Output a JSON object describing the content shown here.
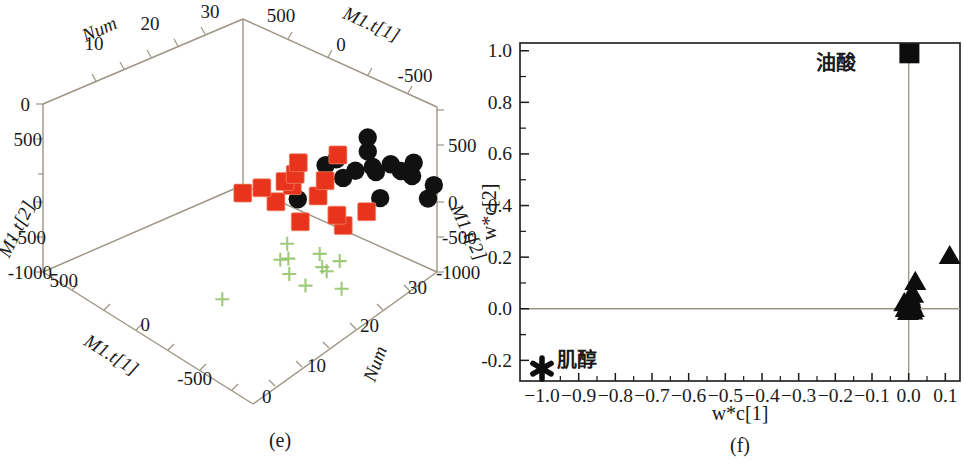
{
  "figure": {
    "panels": [
      {
        "id": "e",
        "caption": "(e)"
      },
      {
        "id": "f",
        "caption": "(f)"
      }
    ]
  },
  "panel_e": {
    "caption": "(e)",
    "axis_titles": {
      "top_left": "Num",
      "top_right": "M1.t[1]",
      "left": "M1.t[2]",
      "right": "M1.t[2]",
      "bottom_left": "M1.t[1]",
      "bottom_right": "Num"
    },
    "ticks": {
      "num_top": [
        "10",
        "20",
        "30"
      ],
      "t1_top": [
        "500",
        "0",
        "-500"
      ],
      "t2_left": [
        "0",
        "500",
        "0",
        "-500",
        "-1000"
      ],
      "t2_right": [
        "500",
        "0",
        "-500",
        "-1000"
      ],
      "t1_bottom": [
        "500",
        "0",
        "-500"
      ],
      "num_bottom": [
        "0",
        "10",
        "20",
        "30"
      ]
    },
    "legend_groups": [
      {
        "name": "black-circles",
        "color": "#111111",
        "marker": "circle"
      },
      {
        "name": "red-squares",
        "color": "#e8341c",
        "marker": "square"
      },
      {
        "name": "green-crosses",
        "color": "#8fbf62",
        "marker": "cross"
      }
    ]
  },
  "panel_f": {
    "caption": "(f)",
    "xlabel": "w*c[1]",
    "ylabel": "w*c[2]",
    "annotations": [
      {
        "text": "油酸",
        "marker": "square",
        "x": 0.0,
        "y": 0.99
      },
      {
        "text": "肌醇",
        "marker": "star",
        "x": -1.0,
        "y": -0.23
      }
    ]
  },
  "chart_data": [
    {
      "type": "scatter",
      "id": "e",
      "title": "",
      "caption": "(e)",
      "projection": "3d",
      "xlabel": "Num",
      "ylabel": "M1.t[1]",
      "zlabel": "M1.t[2]",
      "xlim": [
        0,
        35
      ],
      "ylim": [
        -750,
        750
      ],
      "zlim": [
        -1000,
        750
      ],
      "x_ticks": [
        0,
        10,
        20,
        30
      ],
      "y_ticks": [
        -500,
        0,
        500
      ],
      "z_ticks": [
        -1000,
        -500,
        0,
        500
      ],
      "grid": false,
      "legend": "none",
      "series": [
        {
          "name": "black-circles",
          "marker": "circle",
          "color": "#111111",
          "points": [
            [
              21.0,
              120,
              430
            ],
            [
              24.5,
              330,
              480
            ],
            [
              26.0,
              160,
              500
            ],
            [
              26.8,
              50,
              420
            ],
            [
              28.0,
              240,
              400
            ],
            [
              29.5,
              40,
              390
            ],
            [
              25.5,
              -80,
              340
            ],
            [
              26.5,
              -140,
              300
            ],
            [
              27.8,
              -60,
              350
            ],
            [
              24.0,
              -170,
              330
            ],
            [
              23.0,
              -220,
              250
            ],
            [
              28.5,
              -250,
              280
            ],
            [
              29.8,
              -300,
              330
            ],
            [
              26.0,
              -380,
              180
            ],
            [
              25.0,
              -420,
              120
            ],
            [
              24.5,
              -600,
              -380
            ]
          ]
        },
        {
          "name": "red-squares",
          "marker": "square",
          "color": "#e8341c",
          "points": [
            [
              14.5,
              100,
              380
            ],
            [
              16.5,
              -20,
              300
            ],
            [
              13.0,
              -150,
              250
            ],
            [
              18.5,
              -230,
              230
            ],
            [
              19.5,
              80,
              310
            ],
            [
              15.0,
              -400,
              150
            ],
            [
              20.0,
              -470,
              60
            ],
            [
              22.5,
              -330,
              140
            ],
            [
              21.0,
              -560,
              -20
            ],
            [
              19.0,
              -650,
              -90
            ],
            [
              17.5,
              -730,
              -160
            ],
            [
              24.0,
              -600,
              -100
            ],
            [
              27.0,
              -690,
              -180
            ],
            [
              30.0,
              -520,
              -60
            ]
          ]
        },
        {
          "name": "green-crosses",
          "marker": "cross",
          "color": "#8fbf62",
          "points": [
            [
              3.0,
              520,
              560
            ],
            [
              2.0,
              300,
              430
            ],
            [
              5.5,
              320,
              460
            ],
            [
              6.5,
              250,
              400
            ],
            [
              8.5,
              300,
              430
            ],
            [
              9.5,
              120,
              300
            ],
            [
              7.0,
              -10,
              230
            ],
            [
              6.8,
              -60,
              180
            ],
            [
              10.5,
              -150,
              120
            ],
            [
              4.5,
              90,
              260
            ],
            [
              8.0,
              -520,
              -700
            ]
          ]
        }
      ]
    },
    {
      "type": "scatter",
      "id": "f",
      "title": "",
      "caption": "(f)",
      "xlabel": "w*c[1]",
      "ylabel": "w*c[2]",
      "xlim": [
        -1.06,
        0.14
      ],
      "ylim": [
        -0.28,
        1.03
      ],
      "x_ticks": [
        -1.0,
        -0.9,
        -0.8,
        -0.7,
        -0.6,
        -0.5,
        -0.4,
        -0.3,
        -0.2,
        -0.1,
        0.0,
        0.1
      ],
      "x_tick_labels": [
        "-1.0",
        "-0.9",
        "-0.8",
        "-0.7",
        "-0.6",
        "-0.5",
        "-0.4",
        "-0.3",
        "-0.2",
        "-0.1",
        "0.0",
        "0.1"
      ],
      "y_ticks": [
        -0.2,
        0.0,
        0.2,
        0.4,
        0.6,
        0.8,
        1.0
      ],
      "y_tick_labels": [
        "-0.2",
        "0.0",
        "0.2",
        "0.4",
        "0.6",
        "0.8",
        "1.0"
      ],
      "grid": false,
      "reference_lines": {
        "vertical_x": 0.0,
        "horizontal_y": 0.0
      },
      "legend": "none",
      "series": [
        {
          "name": "y-variable-square",
          "marker": "square",
          "color": "#0d0d0d",
          "label": "油酸",
          "points": [
            [
              0.002,
              0.99
            ]
          ]
        },
        {
          "name": "x-variables-triangles",
          "marker": "triangle",
          "color": "#0d0d0d",
          "points": [
            [
              0.112,
              0.205
            ],
            [
              0.018,
              0.105
            ],
            [
              0.012,
              0.055
            ],
            [
              0.005,
              0.035
            ],
            [
              0.008,
              0.015
            ],
            [
              0.0,
              0.01
            ],
            [
              -0.004,
              0.008
            ],
            [
              -0.012,
              0.022
            ],
            [
              0.002,
              -0.005
            ],
            [
              0.01,
              -0.01
            ],
            [
              -0.002,
              -0.012
            ],
            [
              0.014,
              0.0
            ],
            [
              0.004,
              0.045
            ],
            [
              -0.008,
              0.0
            ],
            [
              0.006,
              0.02
            ]
          ]
        },
        {
          "name": "inositol-star",
          "marker": "star",
          "color": "#0d0d0d",
          "label": "肌醇",
          "points": [
            [
              -1.0,
              -0.232
            ]
          ]
        }
      ]
    }
  ]
}
